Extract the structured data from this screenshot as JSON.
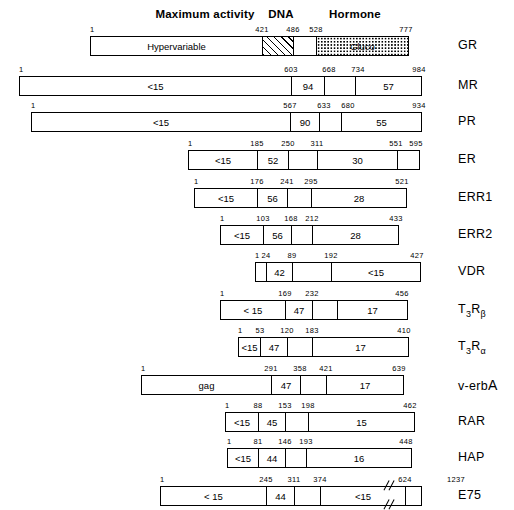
{
  "figure": {
    "type": "domain-map",
    "headers": [
      {
        "label": "Maximum activity",
        "x": 205,
        "y": 8
      },
      {
        "label": "DNA",
        "x": 281,
        "y": 8
      },
      {
        "label": "Hormone",
        "x": 355,
        "y": 8
      }
    ],
    "rows": [
      {
        "name": "GR",
        "name_html": "GR",
        "y": 36,
        "x0": 90,
        "x1": 409,
        "ticks": [
          {
            "v": "1",
            "pos": 90,
            "align": "left"
          },
          {
            "v": "421",
            "pos": 262
          },
          {
            "v": "486",
            "pos": 293
          },
          {
            "v": "528",
            "pos": 316
          },
          {
            "v": "777",
            "pos": 406
          }
        ],
        "segments": [
          {
            "label": "Hypervariable",
            "w": 172,
            "fill": "plain"
          },
          {
            "label": "",
            "w": 31,
            "fill": "hatch"
          },
          {
            "label": "",
            "w": 23,
            "fill": "plain"
          },
          {
            "label": "Gluco",
            "w": 93,
            "fill": "dots"
          }
        ]
      },
      {
        "name": "MR",
        "name_html": "MR",
        "y": 76,
        "x0": 19,
        "x1": 422,
        "ticks": [
          {
            "v": "1",
            "pos": 19,
            "align": "left"
          },
          {
            "v": "603",
            "pos": 291
          },
          {
            "v": "668",
            "pos": 329
          },
          {
            "v": "734",
            "pos": 358
          },
          {
            "v": "984",
            "pos": 419
          }
        ],
        "segments": [
          {
            "label": "<15",
            "w": 272,
            "fill": "plain"
          },
          {
            "label": "94",
            "w": 33,
            "fill": "plain"
          },
          {
            "label": "",
            "w": 31,
            "fill": "plain"
          },
          {
            "label": "57",
            "w": 67,
            "fill": "plain"
          }
        ]
      },
      {
        "name": "PR",
        "name_html": "PR",
        "y": 112,
        "x0": 31,
        "x1": 422,
        "ticks": [
          {
            "v": "1",
            "pos": 31,
            "align": "left"
          },
          {
            "v": "567",
            "pos": 290
          },
          {
            "v": "633",
            "pos": 324
          },
          {
            "v": "680",
            "pos": 348
          },
          {
            "v": "934",
            "pos": 419
          }
        ],
        "segments": [
          {
            "label": "<15",
            "w": 259,
            "fill": "plain"
          },
          {
            "label": "90",
            "w": 29,
            "fill": "plain"
          },
          {
            "label": "",
            "w": 22,
            "fill": "plain"
          },
          {
            "label": "55",
            "w": 81,
            "fill": "plain"
          }
        ]
      },
      {
        "name": "ER",
        "name_html": "ER",
        "y": 150,
        "x0": 188,
        "x1": 420,
        "ticks": [
          {
            "v": "1",
            "pos": 188,
            "align": "left"
          },
          {
            "v": "185",
            "pos": 257
          },
          {
            "v": "250",
            "pos": 288
          },
          {
            "v": "311",
            "pos": 317
          },
          {
            "v": "551",
            "pos": 396
          },
          {
            "v": "595",
            "pos": 416
          }
        ],
        "segments": [
          {
            "label": "<15",
            "w": 69,
            "fill": "plain"
          },
          {
            "label": "52",
            "w": 31,
            "fill": "plain"
          },
          {
            "label": "",
            "w": 29,
            "fill": "plain"
          },
          {
            "label": "30",
            "w": 80,
            "fill": "plain"
          },
          {
            "label": "",
            "w": 23,
            "fill": "plain"
          }
        ]
      },
      {
        "name": "ERR1",
        "name_html": "ERR1",
        "y": 188,
        "x0": 194,
        "x1": 407,
        "ticks": [
          {
            "v": "1",
            "pos": 194,
            "align": "left"
          },
          {
            "v": "176",
            "pos": 257
          },
          {
            "v": "241",
            "pos": 287
          },
          {
            "v": "295",
            "pos": 311
          },
          {
            "v": "521",
            "pos": 402
          }
        ],
        "segments": [
          {
            "label": "<15",
            "w": 63,
            "fill": "plain"
          },
          {
            "label": "56",
            "w": 30,
            "fill": "plain"
          },
          {
            "label": "",
            "w": 24,
            "fill": "plain"
          },
          {
            "label": "28",
            "w": 96,
            "fill": "plain"
          }
        ]
      },
      {
        "name": "ERR2",
        "name_html": "ERR2",
        "y": 225,
        "x0": 220,
        "x1": 399,
        "ticks": [
          {
            "v": "1",
            "pos": 220,
            "align": "left"
          },
          {
            "v": "103",
            "pos": 263
          },
          {
            "v": "168",
            "pos": 291
          },
          {
            "v": "212",
            "pos": 312
          },
          {
            "v": "433",
            "pos": 396
          }
        ],
        "segments": [
          {
            "label": "<15",
            "w": 43,
            "fill": "plain"
          },
          {
            "label": "56",
            "w": 28,
            "fill": "plain"
          },
          {
            "label": "",
            "w": 21,
            "fill": "plain"
          },
          {
            "label": "28",
            "w": 87,
            "fill": "plain"
          }
        ]
      },
      {
        "name": "VDR",
        "name_html": "VDR",
        "y": 262,
        "x0": 255,
        "x1": 421,
        "ticks": [
          {
            "v": "1",
            "pos": 255,
            "align": "left"
          },
          {
            "v": "24",
            "pos": 266
          },
          {
            "v": "89",
            "pos": 292
          },
          {
            "v": "192",
            "pos": 331
          },
          {
            "v": "427",
            "pos": 417
          }
        ],
        "segments": [
          {
            "label": "",
            "w": 11,
            "fill": "plain"
          },
          {
            "label": "42",
            "w": 26,
            "fill": "plain"
          },
          {
            "label": "",
            "w": 39,
            "fill": "plain"
          },
          {
            "label": "<15",
            "w": 90,
            "fill": "plain"
          }
        ]
      },
      {
        "name": "T3Rbeta",
        "name_html": "T<sub>3</sub>R<sub>&beta;</sub>",
        "y": 300,
        "x0": 220,
        "x1": 408,
        "ticks": [
          {
            "v": "1",
            "pos": 220,
            "align": "left"
          },
          {
            "v": "169",
            "pos": 285
          },
          {
            "v": "232",
            "pos": 312
          },
          {
            "v": "456",
            "pos": 402
          }
        ],
        "segments": [
          {
            "label": "< 15",
            "w": 65,
            "fill": "plain"
          },
          {
            "label": "47",
            "w": 27,
            "fill": "plain"
          },
          {
            "label": "",
            "w": 25,
            "fill": "plain"
          },
          {
            "label": "17",
            "w": 71,
            "fill": "plain"
          }
        ]
      },
      {
        "name": "T3Ralpha",
        "name_html": "T<sub>3</sub>R<sub>&alpha;</sub>",
        "y": 337,
        "x0": 238,
        "x1": 409,
        "ticks": [
          {
            "v": "1",
            "pos": 238,
            "align": "left"
          },
          {
            "v": "53",
            "pos": 260
          },
          {
            "v": "120",
            "pos": 287
          },
          {
            "v": "183",
            "pos": 312
          },
          {
            "v": "410",
            "pos": 404
          }
        ],
        "segments": [
          {
            "label": "<15",
            "w": 22,
            "fill": "plain"
          },
          {
            "label": "47",
            "w": 27,
            "fill": "plain"
          },
          {
            "label": "",
            "w": 25,
            "fill": "plain"
          },
          {
            "label": "17",
            "w": 97,
            "fill": "plain"
          }
        ]
      },
      {
        "name": "v-erbA",
        "name_html": "v-erb<span class=\"big\">A</span>",
        "y": 375,
        "x0": 141,
        "x1": 404,
        "ticks": [
          {
            "v": "1",
            "pos": 141,
            "align": "left"
          },
          {
            "v": "291",
            "pos": 271
          },
          {
            "v": "358",
            "pos": 300
          },
          {
            "v": "421",
            "pos": 326
          },
          {
            "v": "639",
            "pos": 399
          }
        ],
        "segments": [
          {
            "label": "gag",
            "w": 130,
            "fill": "plain"
          },
          {
            "label": "47",
            "w": 29,
            "fill": "plain"
          },
          {
            "label": "",
            "w": 26,
            "fill": "plain"
          },
          {
            "label": "17",
            "w": 78,
            "fill": "plain"
          }
        ]
      },
      {
        "name": "RAR",
        "name_html": "RAR",
        "y": 412,
        "x0": 225,
        "x1": 415,
        "ticks": [
          {
            "v": "1",
            "pos": 225,
            "align": "left"
          },
          {
            "v": "88",
            "pos": 258
          },
          {
            "v": "153",
            "pos": 285
          },
          {
            "v": "198",
            "pos": 308
          },
          {
            "v": "462",
            "pos": 410
          }
        ],
        "segments": [
          {
            "label": "<15",
            "w": 33,
            "fill": "plain"
          },
          {
            "label": "45",
            "w": 27,
            "fill": "plain"
          },
          {
            "label": "",
            "w": 23,
            "fill": "plain"
          },
          {
            "label": "15",
            "w": 107,
            "fill": "plain"
          }
        ]
      },
      {
        "name": "HAP",
        "name_html": "HAP",
        "y": 448,
        "x0": 227,
        "x1": 412,
        "ticks": [
          {
            "v": "1",
            "pos": 227,
            "align": "left"
          },
          {
            "v": "81",
            "pos": 258
          },
          {
            "v": "146",
            "pos": 285
          },
          {
            "v": "193",
            "pos": 306
          },
          {
            "v": "448",
            "pos": 406
          }
        ],
        "segments": [
          {
            "label": "<15",
            "w": 31,
            "fill": "plain"
          },
          {
            "label": "44",
            "w": 27,
            "fill": "plain"
          },
          {
            "label": "",
            "w": 21,
            "fill": "plain"
          },
          {
            "label": "16",
            "w": 106,
            "fill": "plain"
          }
        ]
      },
      {
        "name": "E75",
        "name_html": "E75",
        "y": 486,
        "x0": 160,
        "x1": 422,
        "broken": true,
        "ticks": [
          {
            "v": "1",
            "pos": 160,
            "align": "left"
          },
          {
            "v": "245",
            "pos": 266
          },
          {
            "v": "311",
            "pos": 294
          },
          {
            "v": "374",
            "pos": 320
          },
          {
            "v": "624",
            "pos": 405
          },
          {
            "v": "1237",
            "pos": 456
          }
        ],
        "segments": [
          {
            "label": "< 15",
            "w": 106,
            "fill": "plain"
          },
          {
            "label": "44",
            "w": 28,
            "fill": "plain"
          },
          {
            "label": "",
            "w": 26,
            "fill": "plain"
          },
          {
            "label": "<15",
            "w": 85,
            "fill": "plain"
          },
          {
            "label": "",
            "w": 17,
            "fill": "plain"
          }
        ]
      }
    ],
    "label_x": 458
  }
}
